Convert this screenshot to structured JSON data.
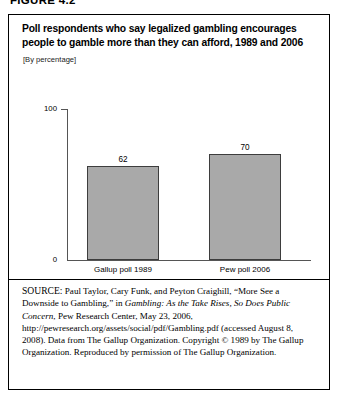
{
  "figure": {
    "label": "FIGURE 4.2",
    "title": "Poll respondents who say legalized gambling encourages people to gamble more than they can afford, 1989 and 2006",
    "units_note": "[By percentage]"
  },
  "chart_data": {
    "type": "bar",
    "title": "Poll respondents who say legalized gambling encourages people to gamble more than they can afford, 1989 and 2006",
    "subtitle": "[By percentage]",
    "categories": [
      "Gallup poll 1989",
      "Pew poll 2006"
    ],
    "values": [
      62,
      70
    ],
    "data_labels": [
      "62",
      "70"
    ],
    "xlabel": "",
    "ylabel": "",
    "ylim": [
      0,
      100
    ],
    "ytick_labels": [
      "0",
      "100"
    ],
    "grid": false,
    "legend": "none",
    "bar_color": "#a9a9a9",
    "bar_border_color": "#3d3d3d",
    "axis_color": "#555555"
  },
  "source": {
    "prefix": "SOURCE:",
    "segment_1": " Paul Taylor, Cary Funk, and Peyton Craighill, “More See a Downside to Gambling,” in ",
    "italic_1": "Gambling: As the Take Rises, So Does Public Concern",
    "segment_2": ", Pew Research Center, May 23, 2006, http://pewresearch.org/assets/social/pdf/Gambling.pdf (accessed August 8, 2008). Data from The Gallup Organization. Copyright © 1989 by The Gallup Organization. Reproduced by permission of The Gallup Organization."
  }
}
